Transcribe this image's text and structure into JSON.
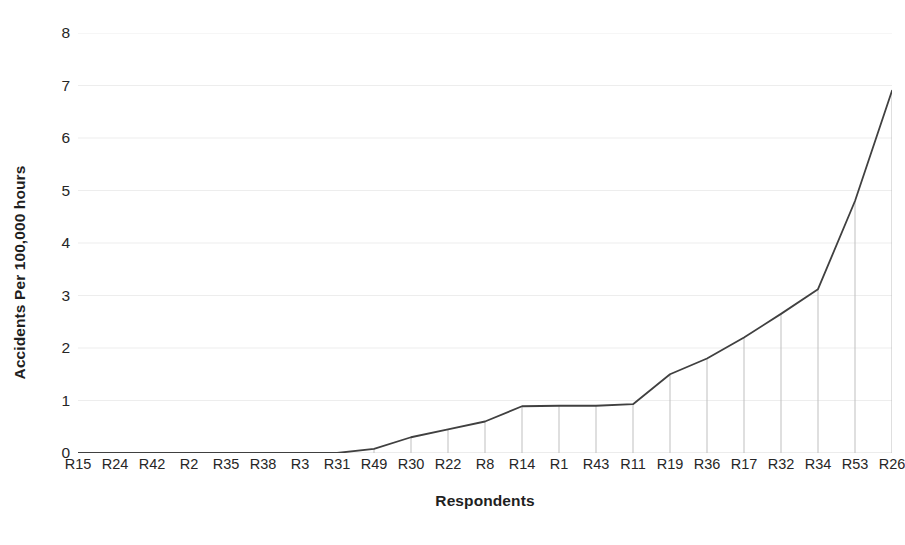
{
  "chart_data": {
    "type": "line",
    "title": "",
    "xlabel": "Respondents",
    "ylabel": "Accidents Per 100,000 hours",
    "categories": [
      "R15",
      "R24",
      "R42",
      "R2",
      "R35",
      "R38",
      "R3",
      "R31",
      "R49",
      "R30",
      "R22",
      "R8",
      "R14",
      "R1",
      "R43",
      "R11",
      "R19",
      "R36",
      "R17",
      "R32",
      "R34",
      "R53",
      "R26"
    ],
    "values": [
      0,
      0,
      0,
      0,
      0,
      0,
      0,
      0,
      0.08,
      0.3,
      0.45,
      0.6,
      0.89,
      0.9,
      0.9,
      0.93,
      1.5,
      1.8,
      2.2,
      2.65,
      3.12,
      4.8,
      6.9
    ],
    "series": [
      {
        "name": "Accidents Per 100,000 hours",
        "values": [
          0,
          0,
          0,
          0,
          0,
          0,
          0,
          0,
          0.08,
          0.3,
          0.45,
          0.6,
          0.89,
          0.9,
          0.9,
          0.93,
          1.5,
          1.8,
          2.2,
          2.65,
          3.12,
          4.8,
          6.9
        ]
      }
    ],
    "ylim": [
      0,
      8
    ],
    "yticks": [
      0,
      1,
      2,
      3,
      4,
      5,
      6,
      7,
      8
    ],
    "ytick_labels": [
      "0",
      "1",
      "2",
      "3",
      "4",
      "5",
      "6",
      "7",
      "8"
    ],
    "grid": "horizontal",
    "droplines": true,
    "legend": "none",
    "line_color": "#404040",
    "grid_color": "#ededed",
    "dropline_color": "#bfbfbf",
    "axis_color": "#d9d9d9",
    "text_color": "#262626"
  }
}
